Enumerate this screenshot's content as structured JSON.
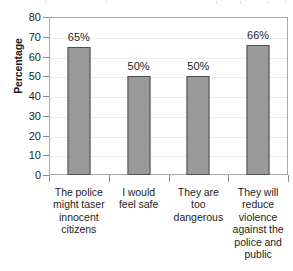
{
  "chart_data": {
    "type": "bar",
    "title": "",
    "xlabel": "",
    "ylabel": "Percentage",
    "ylim": [
      0,
      80
    ],
    "yticks": [
      0,
      10,
      20,
      30,
      40,
      50,
      60,
      70,
      80
    ],
    "ytick_labels": [
      "0",
      "10",
      "20",
      "30",
      "40",
      "50",
      "60",
      "70",
      "80"
    ],
    "grid": true,
    "legend": false,
    "categories": [
      "The police might taser innocent citizens",
      "I would feel safe",
      "They are too dangerous",
      "They will reduce violence against the police and public"
    ],
    "category_lines": [
      [
        "The police",
        "might taser",
        "innocent",
        "citizens"
      ],
      [
        "I would",
        "feel safe"
      ],
      [
        "They are",
        "too",
        "dangerous"
      ],
      [
        "They will",
        "reduce",
        "violence",
        "against the",
        "police and",
        "public"
      ]
    ],
    "values": [
      65,
      50,
      50,
      66
    ],
    "data_labels": [
      "65%",
      "50%",
      "50%",
      "66%"
    ],
    "colors": {
      "bar_fill": "#9a9a9a",
      "bar_border": "#4f4f4f",
      "grid": "#ececec",
      "axis": "#a9a9a9",
      "text": "#1d1d1d",
      "background": "#ffffff"
    }
  }
}
